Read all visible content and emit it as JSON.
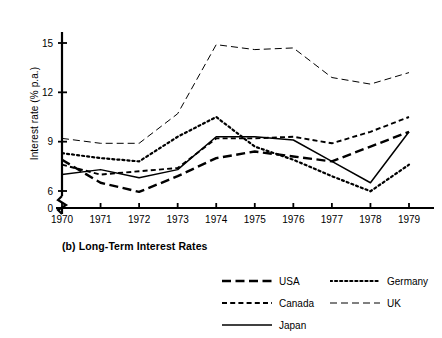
{
  "chart_data": {
    "type": "line",
    "title": "(b) Long-Term Interest Rates",
    "xlabel": "",
    "ylabel": "Interest rate (% p.a.)",
    "categories": [
      "1970",
      "1971",
      "1972",
      "1973",
      "1974",
      "1975",
      "1976",
      "1977",
      "1978",
      "1979"
    ],
    "x": [
      1970,
      1971,
      1972,
      1973,
      1974,
      1975,
      1976,
      1977,
      1978,
      1979
    ],
    "xlim": [
      1970,
      1979
    ],
    "ylim": [
      0,
      16
    ],
    "y_ticks": [
      0,
      6,
      9,
      12,
      15
    ],
    "y_tick_labels": [
      "0",
      "6",
      "9",
      "12",
      "15"
    ],
    "axis_break": true,
    "axis_break_between": [
      0,
      6
    ],
    "grid": false,
    "legend_position": "bottom",
    "series": [
      {
        "name": "USA",
        "line_style": "long-dash",
        "color": "#000000",
        "width": 2.4,
        "values": [
          7.9,
          6.5,
          5.7,
          6.9,
          8.0,
          8.4,
          8.1,
          7.8,
          8.7,
          9.6
        ]
      },
      {
        "name": "Canada",
        "line_style": "short-dash",
        "color": "#000000",
        "width": 1.9,
        "values": [
          7.6,
          7.0,
          7.2,
          7.4,
          9.2,
          9.2,
          9.3,
          8.9,
          9.6,
          10.5
        ]
      },
      {
        "name": "Japan",
        "line_style": "solid",
        "color": "#000000",
        "width": 1.5,
        "values": [
          7.0,
          7.3,
          6.8,
          7.3,
          9.3,
          9.3,
          9.1,
          7.8,
          6.5,
          9.6
        ]
      },
      {
        "name": "Germany",
        "line_style": "dotted",
        "color": "#000000",
        "width": 2.2,
        "values": [
          8.3,
          8.0,
          7.8,
          9.3,
          10.5,
          8.7,
          7.9,
          6.9,
          5.9,
          7.6
        ]
      },
      {
        "name": "UK",
        "line_style": "dash-dash",
        "color": "#000000",
        "width": 1.0,
        "values": [
          9.2,
          8.9,
          8.9,
          10.7,
          14.9,
          14.6,
          14.7,
          12.9,
          12.5,
          13.2
        ]
      }
    ]
  },
  "axis": {
    "y_title": "Interest rate (% p.a.)",
    "x_labels": [
      "1970",
      "1971",
      "1972",
      "1973",
      "1974",
      "1975",
      "1976",
      "1977",
      "1978",
      "1979"
    ],
    "y_labels": [
      "15",
      "12",
      "9",
      "6",
      "0"
    ]
  },
  "caption": {
    "text": "(b) Long-Term Interest Rates"
  },
  "legend": {
    "rows": [
      {
        "left": "USA",
        "right": "Germany"
      },
      {
        "left": "Canada",
        "right": "UK"
      },
      {
        "left": "Japan",
        "right": ""
      }
    ],
    "items": [
      {
        "label": "USA",
        "style": "long-dash"
      },
      {
        "label": "Germany",
        "style": "dotted"
      },
      {
        "label": "Canada",
        "style": "short-dash"
      },
      {
        "label": "UK",
        "style": "dash-dash"
      },
      {
        "label": "Japan",
        "style": "solid"
      }
    ]
  }
}
